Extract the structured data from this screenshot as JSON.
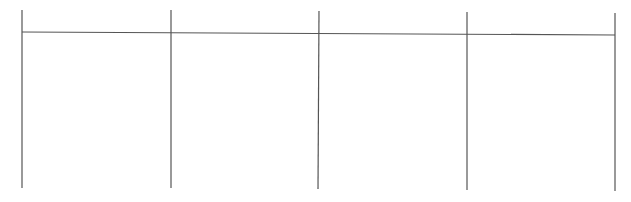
{
  "table": {
    "columns": 4,
    "header_row": [
      "",
      "",
      "",
      ""
    ],
    "body_row": [
      "",
      "",
      "",
      ""
    ],
    "line_color": "#555555",
    "background_color": "#ffffff",
    "vertical_lines": [
      {
        "x1": 22,
        "y1": 10,
        "x2": 22,
        "y2": 188
      },
      {
        "x1": 171,
        "y1": 10,
        "x2": 171,
        "y2": 188
      },
      {
        "x1": 319,
        "y1": 11,
        "x2": 318,
        "y2": 189
      },
      {
        "x1": 467,
        "y1": 12,
        "x2": 467,
        "y2": 190
      },
      {
        "x1": 615,
        "y1": 13,
        "x2": 615,
        "y2": 191
      }
    ],
    "horizontal_lines": [
      {
        "x1": 22,
        "y1": 32,
        "x2": 615,
        "y2": 35
      }
    ]
  }
}
